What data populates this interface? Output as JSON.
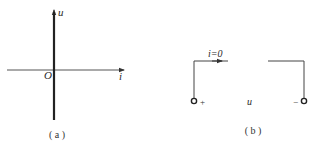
{
  "figure_a": {
    "caption": "( a )",
    "y_axis_label": "u",
    "x_axis_label": "i",
    "origin_label": "O",
    "description": "u-i characteristic: vertical line along u axis (open circuit)"
  },
  "figure_b": {
    "caption": "( b )",
    "current_label": "i=0",
    "voltage_label": "u",
    "plus_terminal": "+",
    "minus_terminal": "−",
    "description": "Open circuit between two terminals"
  },
  "colors": {
    "line": "#333333",
    "text": "#2a2a2a",
    "background": "#ffffff"
  }
}
